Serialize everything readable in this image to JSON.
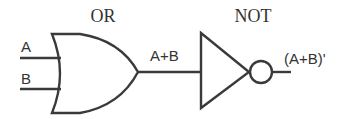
{
  "diagram": {
    "title_or": "OR",
    "title_not": "NOT",
    "inputs": [
      {
        "label": "A"
      },
      {
        "label": "B"
      }
    ],
    "intermediate_label": "A+B",
    "output_label": "(A+B)'",
    "gates": [
      {
        "type": "OR",
        "inputs": [
          "A",
          "B"
        ],
        "output": "A+B"
      },
      {
        "type": "NOT",
        "inputs": [
          "A+B"
        ],
        "output": "(A+B)'"
      }
    ],
    "colors": {
      "stroke": "#3a3a3a",
      "text": "#333333",
      "background": "#ffffff"
    }
  }
}
